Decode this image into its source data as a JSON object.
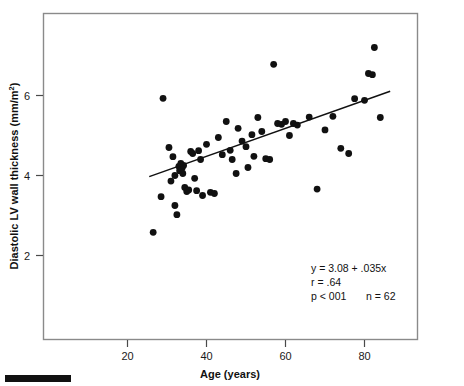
{
  "figure": {
    "frame": {
      "x": 43,
      "y": 13,
      "width": 375,
      "height": 327,
      "border_color": "#8a8a8a"
    },
    "scale_bar": {
      "x": 5,
      "y": 375,
      "width": 66,
      "height": 7,
      "color": "#111111"
    }
  },
  "chart_data": {
    "type": "scatter",
    "title": "",
    "xlabel": "Age (years)",
    "ylabel": "Diastolic LV wall thickness (mm/m²)",
    "ylabel_main": "Diastolic LV wall thickness (mm/m",
    "ylabel_sup": "2",
    "ylabel_tail": ")",
    "xticks": [
      20,
      40,
      60,
      80
    ],
    "yticks": [
      2,
      4,
      6
    ],
    "xlim": [
      8,
      92
    ],
    "ylim": [
      1.0,
      7.6
    ],
    "grid": false,
    "legend": false,
    "marker_color": "#111111",
    "marker_radius": 3.4,
    "line_color": "#111111",
    "regression": {
      "equation": "y = 3.08 + .035x",
      "slope": 0.035,
      "intercept": 3.08,
      "r": ".64",
      "p": "p < 001",
      "n": "n = 62",
      "x_start": 25.5,
      "x_end": 86.5
    },
    "annotations": [
      "y = 3.08 + .035x",
      "r = .64",
      "p < 001    n = 62"
    ],
    "annotation_r_label": "r = .64",
    "annotation_p_label": "p < 001",
    "annotation_n_label": "n = 62",
    "points": [
      [
        26.5,
        2.58
      ],
      [
        28.5,
        3.47
      ],
      [
        29.0,
        5.93
      ],
      [
        30.5,
        4.7
      ],
      [
        31.0,
        3.86
      ],
      [
        31.5,
        4.47
      ],
      [
        32.0,
        3.25
      ],
      [
        32.0,
        4.0
      ],
      [
        32.5,
        3.02
      ],
      [
        33.0,
        4.23
      ],
      [
        33.2,
        4.12
      ],
      [
        33.5,
        4.3
      ],
      [
        33.8,
        4.18
      ],
      [
        34.0,
        4.05
      ],
      [
        34.2,
        4.25
      ],
      [
        34.5,
        3.7
      ],
      [
        35.0,
        3.6
      ],
      [
        35.5,
        3.64
      ],
      [
        36.0,
        4.6
      ],
      [
        36.5,
        4.55
      ],
      [
        37.0,
        3.93
      ],
      [
        37.5,
        3.62
      ],
      [
        38.0,
        4.62
      ],
      [
        38.5,
        4.4
      ],
      [
        39.0,
        3.5
      ],
      [
        40.0,
        4.78
      ],
      [
        41.0,
        3.58
      ],
      [
        42.0,
        3.55
      ],
      [
        43.0,
        4.95
      ],
      [
        44.0,
        4.52
      ],
      [
        45.0,
        5.35
      ],
      [
        46.0,
        4.63
      ],
      [
        46.5,
        4.4
      ],
      [
        47.5,
        4.05
      ],
      [
        48.0,
        5.18
      ],
      [
        49.0,
        4.86
      ],
      [
        50.0,
        4.72
      ],
      [
        50.5,
        4.2
      ],
      [
        51.5,
        5.02
      ],
      [
        52.0,
        4.48
      ],
      [
        53.0,
        5.45
      ],
      [
        54.0,
        5.1
      ],
      [
        55.0,
        4.42
      ],
      [
        56.0,
        4.4
      ],
      [
        57.0,
        6.78
      ],
      [
        58.0,
        5.3
      ],
      [
        59.0,
        5.28
      ],
      [
        60.0,
        5.35
      ],
      [
        61.0,
        5.0
      ],
      [
        62.0,
        5.3
      ],
      [
        63.0,
        5.26
      ],
      [
        66.0,
        5.46
      ],
      [
        68.0,
        3.66
      ],
      [
        70.0,
        5.14
      ],
      [
        72.0,
        5.48
      ],
      [
        74.0,
        4.68
      ],
      [
        76.0,
        4.55
      ],
      [
        77.5,
        5.92
      ],
      [
        80.0,
        5.88
      ],
      [
        81.0,
        6.55
      ],
      [
        82.0,
        6.52
      ],
      [
        82.5,
        7.2
      ],
      [
        84.0,
        5.45
      ]
    ]
  }
}
